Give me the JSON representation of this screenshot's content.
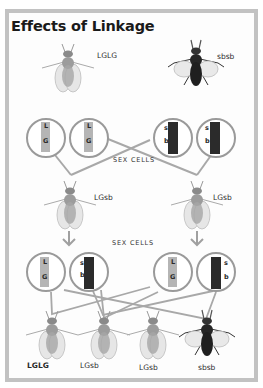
{
  "title": "Effects of Linkage",
  "colors": {
    "frame": "#c2c2c2",
    "line": "#a8a8a8",
    "pale_chromosome": "#b5b5b5",
    "dark_chromosome": "#2b2b2b",
    "pale_fly_body": "#9c9c9c",
    "dark_fly_body": "#262626"
  },
  "parents": [
    {
      "genotype": "LGLG",
      "type": "pale"
    },
    {
      "genotype": "sbsb",
      "type": "dark"
    }
  ],
  "sex_cells_label": "SEX CELLS",
  "row1_cells": [
    {
      "top": "L",
      "bottom": "G",
      "type": "pale"
    },
    {
      "top": "L",
      "bottom": "G",
      "type": "pale"
    },
    {
      "top": "s",
      "bottom": "b",
      "type": "dark"
    },
    {
      "top": "s",
      "bottom": "b",
      "type": "dark"
    }
  ],
  "f1": [
    {
      "genotype": "LGsb",
      "type": "pale"
    },
    {
      "genotype": "LGsb",
      "type": "pale"
    }
  ],
  "row2_cells": [
    {
      "top": "L",
      "bottom": "G",
      "type": "pale"
    },
    {
      "top": "s",
      "bottom": "b",
      "type": "dark"
    },
    {
      "top": "L",
      "bottom": "G",
      "type": "pale"
    },
    {
      "top": "s",
      "bottom": "b",
      "type": "dark"
    }
  ],
  "f2": [
    {
      "genotype": "LGLG",
      "type": "pale"
    },
    {
      "genotype": "LGsb",
      "type": "pale"
    },
    {
      "genotype": "LGsb",
      "type": "pale"
    },
    {
      "genotype": "sbsb",
      "type": "dark"
    }
  ]
}
